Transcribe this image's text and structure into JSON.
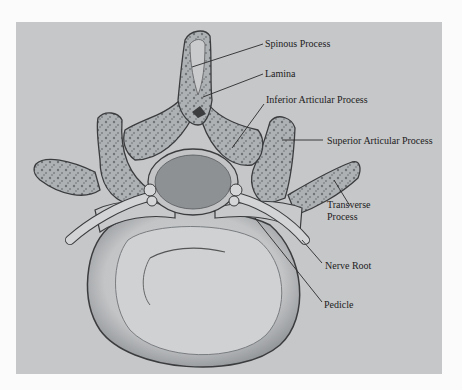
{
  "figure": {
    "background_color": "#c6c7c9",
    "bone_color": "#b9bcbf",
    "canal_color": "#8e9193",
    "outline_color": "#3a3c3e"
  },
  "labels": [
    {
      "id": "spinous-process",
      "text": "Spinous Process",
      "x": 265,
      "y": 38,
      "line": [
        263,
        44,
        192,
        67
      ]
    },
    {
      "id": "lamina",
      "text": "Lamina",
      "x": 265,
      "y": 68,
      "line": [
        263,
        74,
        203,
        97
      ]
    },
    {
      "id": "inferior-articular-process",
      "text": "Inferior Articular Process",
      "x": 266,
      "y": 94,
      "line": [
        264,
        104,
        232,
        148
      ]
    },
    {
      "id": "superior-articular-process",
      "text": "Superior Articular Process",
      "x": 327,
      "y": 135,
      "line": [
        282,
        140,
        323,
        140
      ]
    },
    {
      "id": "transverse-process",
      "text": "Transverse Process",
      "x": 327,
      "y": 199,
      "line": [
        334,
        180,
        350,
        206
      ]
    },
    {
      "id": "nerve-root",
      "text": "Nerve Root",
      "x": 325,
      "y": 260,
      "line": [
        302,
        240,
        322,
        263
      ]
    },
    {
      "id": "pedicle",
      "text": "Pedicle",
      "x": 324,
      "y": 299,
      "line": [
        255,
        218,
        322,
        302
      ]
    }
  ]
}
